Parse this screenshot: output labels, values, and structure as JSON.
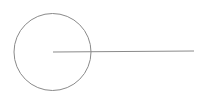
{
  "diagram": {
    "background": "#ffffff",
    "stroke_color": "#8a8a8a",
    "circle": {
      "cx": 52.5,
      "cy": 52,
      "r": 38.5,
      "stroke_width": 1
    },
    "radius_line": {
      "x1": 53,
      "y1": 52,
      "x2": 194,
      "y2": 51,
      "stroke_width": 1
    }
  }
}
